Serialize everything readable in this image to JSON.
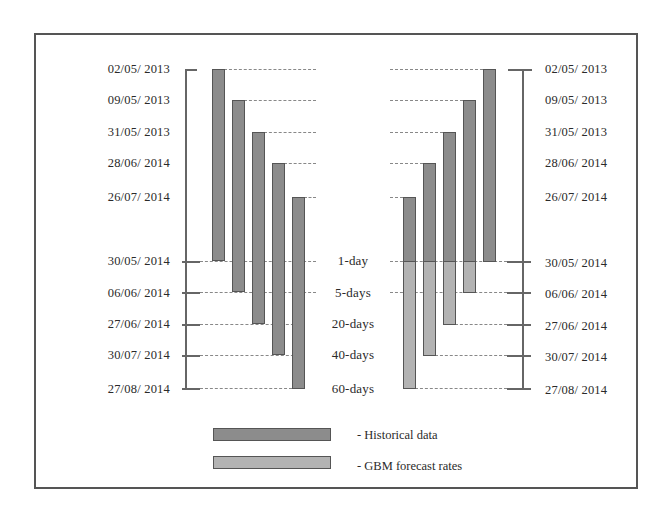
{
  "colors": {
    "historical": "#8c8c8c",
    "forecast": "#b3b3b3",
    "frame": "#555555"
  },
  "left_axis": {
    "start_dates": [
      "02/05/ 2013",
      "09/05/ 2013",
      "31/05/ 2013",
      "28/06/ 2014",
      "26/07/ 2014"
    ],
    "end_dates": [
      "30/05/ 2014",
      "06/06/ 2014",
      "27/06/ 2014",
      "30/07/ 2014",
      "27/08/ 2014"
    ]
  },
  "right_axis": {
    "start_dates": [
      "02/05/ 2013",
      "09/05/ 2013",
      "31/05/ 2013",
      "28/06/ 2014",
      "26/07/ 2014"
    ],
    "end_dates": [
      "30/05/ 2014",
      "06/06/ 2014",
      "27/06/ 2014",
      "30/07/ 2014",
      "27/08/ 2014"
    ]
  },
  "horizons": [
    "1-day",
    "5-days",
    "20-days",
    "40-days",
    "60-days"
  ],
  "legend": {
    "historical": "- Historical data",
    "forecast": "- GBM forecast rates"
  },
  "left_bars": [
    {
      "horizon": "1-day",
      "start": "02/05/ 2013",
      "end": "30/05/ 2014",
      "type": "historical"
    },
    {
      "horizon": "5-days",
      "start": "09/05/ 2013",
      "end": "06/06/ 2014",
      "type": "historical"
    },
    {
      "horizon": "20-days",
      "start": "31/05/ 2013",
      "end": "27/06/ 2014",
      "type": "historical"
    },
    {
      "horizon": "40-days",
      "start": "28/06/ 2014",
      "end": "30/07/ 2014",
      "type": "historical"
    },
    {
      "horizon": "60-days",
      "start": "26/07/ 2014",
      "end": "27/08/ 2014",
      "type": "historical"
    }
  ],
  "right_bars": [
    {
      "horizon": "60-days",
      "historical_start": "26/07/ 2014",
      "split": "30/05/ 2014",
      "forecast_end": "27/08/ 2014"
    },
    {
      "horizon": "40-days",
      "historical_start": "28/06/ 2014",
      "split": "30/05/ 2014",
      "forecast_end": "30/07/ 2014"
    },
    {
      "horizon": "20-days",
      "historical_start": "31/05/ 2013",
      "split": "30/05/ 2014",
      "forecast_end": "27/06/ 2014"
    },
    {
      "horizon": "5-days",
      "historical_start": "09/05/ 2013",
      "split": "30/05/ 2014",
      "forecast_end": "06/06/ 2014"
    },
    {
      "horizon": "1-day",
      "historical_start": "02/05/ 2013",
      "split": "30/05/ 2014",
      "forecast_end": "30/05/ 2014"
    }
  ]
}
